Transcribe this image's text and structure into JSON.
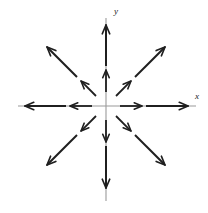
{
  "figure": {
    "background_color": "#ffffff",
    "width": 208,
    "height": 213
  },
  "axes": {
    "x_label": "x",
    "y_label": "y",
    "axis_color": "#9a9a9a",
    "origin": {
      "x": 106,
      "y": 106
    },
    "x_axis": {
      "x1": 18,
      "y1": 106,
      "x2": 196,
      "y2": 106
    },
    "y_axis": {
      "x1": 106,
      "y1": 18,
      "x2": 106,
      "y2": 201
    }
  },
  "chart_data": {
    "type": "scatter",
    "xlabel": "x",
    "ylabel": "y",
    "field_type": "radial-outward",
    "grid": false,
    "legend": null,
    "arrow_color": "#1f1f1f",
    "directions_deg": [
      0,
      45,
      90,
      135,
      180,
      225,
      270,
      315
    ],
    "rings": [
      {
        "name": "inner",
        "start_radius": 14,
        "end_radius": 36
      },
      {
        "name": "outer",
        "start_radius": 40,
        "end_radius": 82
      }
    ],
    "vectors": [
      {
        "ring": "inner",
        "angle_deg": 0,
        "x1": 120,
        "y1": 106,
        "x2": 142,
        "y2": 106
      },
      {
        "ring": "inner",
        "angle_deg": 45,
        "x1": 116,
        "y1": 96,
        "x2": 131,
        "y2": 81
      },
      {
        "ring": "inner",
        "angle_deg": 90,
        "x1": 106,
        "y1": 92,
        "x2": 106,
        "y2": 70
      },
      {
        "ring": "inner",
        "angle_deg": 135,
        "x1": 96,
        "y1": 96,
        "x2": 81,
        "y2": 81
      },
      {
        "ring": "inner",
        "angle_deg": 180,
        "x1": 92,
        "y1": 106,
        "x2": 70,
        "y2": 106
      },
      {
        "ring": "inner",
        "angle_deg": 225,
        "x1": 96,
        "y1": 116,
        "x2": 81,
        "y2": 131
      },
      {
        "ring": "inner",
        "angle_deg": 270,
        "x1": 106,
        "y1": 120,
        "x2": 106,
        "y2": 142
      },
      {
        "ring": "inner",
        "angle_deg": 315,
        "x1": 116,
        "y1": 116,
        "x2": 131,
        "y2": 131
      },
      {
        "ring": "outer",
        "angle_deg": 0,
        "x1": 146,
        "y1": 106,
        "x2": 188,
        "y2": 106
      },
      {
        "ring": "outer",
        "angle_deg": 45,
        "x1": 135,
        "y1": 77,
        "x2": 165,
        "y2": 47
      },
      {
        "ring": "outer",
        "angle_deg": 90,
        "x1": 106,
        "y1": 66,
        "x2": 106,
        "y2": 25
      },
      {
        "ring": "outer",
        "angle_deg": 135,
        "x1": 77,
        "y1": 77,
        "x2": 47,
        "y2": 47
      },
      {
        "ring": "outer",
        "angle_deg": 180,
        "x1": 66,
        "y1": 106,
        "x2": 25,
        "y2": 106
      },
      {
        "ring": "outer",
        "angle_deg": 225,
        "x1": 77,
        "y1": 135,
        "x2": 47,
        "y2": 165
      },
      {
        "ring": "outer",
        "angle_deg": 270,
        "x1": 106,
        "y1": 146,
        "x2": 106,
        "y2": 188
      },
      {
        "ring": "outer",
        "angle_deg": 315,
        "x1": 135,
        "y1": 135,
        "x2": 165,
        "y2": 165
      }
    ]
  }
}
